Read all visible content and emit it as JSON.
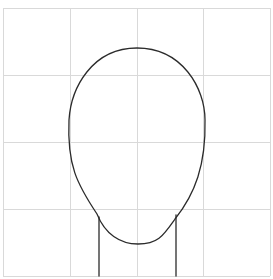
{
  "canvas": {
    "width": 273,
    "height": 279,
    "background": "#ffffff"
  },
  "grid": {
    "rows": 4,
    "cols": 4,
    "color": "#d9d9d9",
    "vertical_x": [
      3,
      70,
      137,
      203,
      270
    ],
    "horizontal_y": [
      8,
      75,
      142,
      209,
      276
    ]
  },
  "figure": {
    "stroke_color": "#2b2b2b",
    "head": {
      "top": [
        137,
        48
      ],
      "left_extreme": [
        69,
        135
      ],
      "right_extreme": [
        205,
        135
      ],
      "chin": [
        138,
        244
      ]
    },
    "neck": {
      "left_line": {
        "x": 99,
        "y_start": 217,
        "y_end": 276
      },
      "right_line": {
        "x": 176,
        "y_start": 215,
        "y_end": 276
      }
    }
  }
}
